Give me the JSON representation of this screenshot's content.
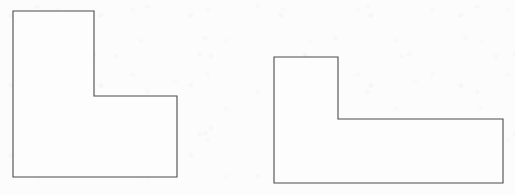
{
  "figure": {
    "background_color": "#fbfbfb",
    "stroke_color": "#4a4a4a",
    "fill_color": "#fdfdfd",
    "stroke_width": 1.1,
    "canvas_width": 515,
    "canvas_height": 195
  },
  "chart_data": {
    "type": "diagram",
    "shapes": [
      {
        "id": "shape-left",
        "label": "Left L-shape",
        "orientation": "upright-L",
        "vertex_count": 6,
        "points": [
          [
            13,
            11
          ],
          [
            94,
            11
          ],
          [
            94,
            96
          ],
          [
            177,
            96
          ],
          [
            177,
            177
          ],
          [
            13,
            177
          ]
        ],
        "points_attr": "13,11 94,11 94,96 177,96 177,177 13,177",
        "bounding_box": {
          "x": 13,
          "y": 11,
          "width": 164,
          "height": 166
        },
        "vertical_arm": {
          "x": 13,
          "y": 11,
          "width": 81,
          "height": 166
        },
        "horizontal_arm": {
          "x": 13,
          "y": 96,
          "width": 164,
          "height": 81
        }
      },
      {
        "id": "shape-right",
        "label": "Right L-shape",
        "orientation": "upright-L-wide",
        "vertex_count": 6,
        "points": [
          [
            274,
            57
          ],
          [
            338,
            57
          ],
          [
            338,
            119
          ],
          [
            503,
            119
          ],
          [
            503,
            183
          ],
          [
            274,
            183
          ]
        ],
        "points_attr": "274,57 338,57 338,119 503,119 503,183 274,183",
        "bounding_box": {
          "x": 274,
          "y": 57,
          "width": 229,
          "height": 126
        },
        "vertical_arm": {
          "x": 274,
          "y": 57,
          "width": 64,
          "height": 126
        },
        "horizontal_arm": {
          "x": 274,
          "y": 119,
          "width": 229,
          "height": 64
        }
      }
    ]
  }
}
